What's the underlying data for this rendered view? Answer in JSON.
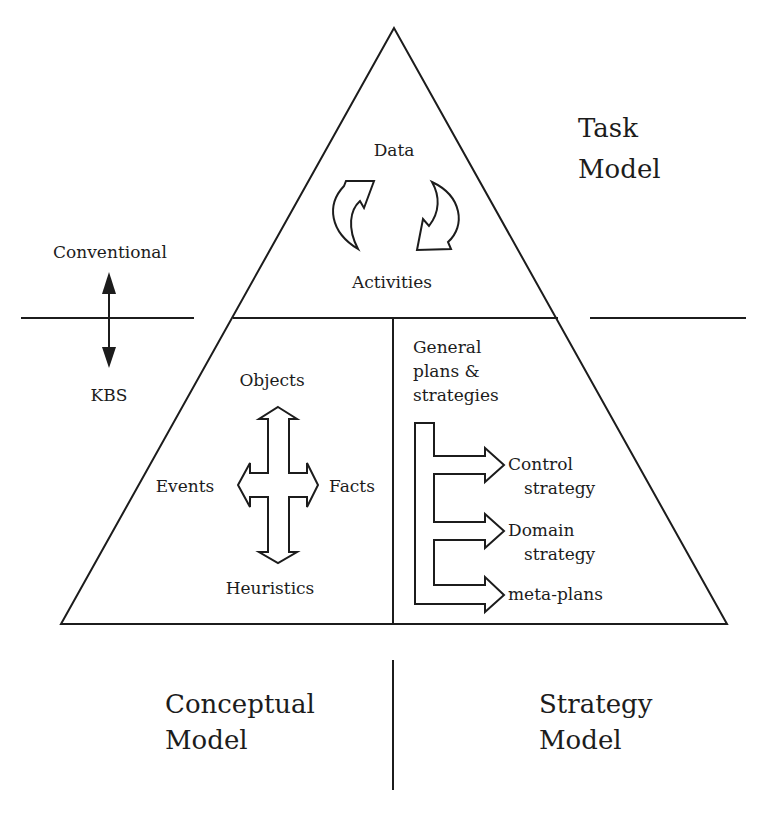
{
  "diagram": {
    "type": "pyramid",
    "colors": {
      "stroke": "#1c1c1c",
      "background": "#ffffff"
    },
    "task_section": {
      "title_line1": "Task",
      "title_line2": "Model",
      "top_label": "Data",
      "bottom_label": "Activities",
      "icon": "cycle-arrows-icon"
    },
    "side_axis": {
      "top_label": "Conventional",
      "bottom_label": "KBS",
      "icon": "double-headed-vertical-arrow-icon"
    },
    "conceptual_section": {
      "title_line1": "Conceptual",
      "title_line2": "Model",
      "top_label": "Objects",
      "left_label": "Events",
      "right_label": "Facts",
      "bottom_label": "Heuristics",
      "icon": "four-way-arrow-icon"
    },
    "strategy_section": {
      "title_line1": "Strategy",
      "title_line2": "Model",
      "header_line1": "General",
      "header_line2": "plans &",
      "header_line3": "strategies",
      "branches": [
        {
          "line1": "Control",
          "line2": "strategy"
        },
        {
          "line1": "Domain",
          "line2": "strategy"
        },
        {
          "line1": "meta-plans",
          "line2": ""
        }
      ],
      "icon": "branching-arrow-icon"
    }
  }
}
